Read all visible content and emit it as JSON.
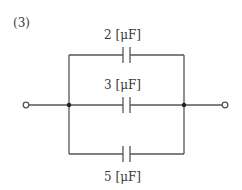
{
  "problem": {
    "number_label": "(3)"
  },
  "circuit": {
    "topology": "three capacitors in parallel between two terminals",
    "capacitors": [
      {
        "id": "C1",
        "branch": "top",
        "value": 2,
        "unit": "μF",
        "label": "2 [μF]"
      },
      {
        "id": "C2",
        "branch": "middle",
        "value": 3,
        "unit": "μF",
        "label": "3 [μF]"
      },
      {
        "id": "C3",
        "branch": "bottom",
        "value": 5,
        "unit": "μF",
        "label": "5 [μF]"
      }
    ],
    "terminals": [
      "left",
      "right"
    ],
    "junctions": [
      "left-node",
      "right-node"
    ]
  },
  "colors": {
    "wire": "#555555",
    "text": "#3a3a3a",
    "background": "#ffffff"
  }
}
